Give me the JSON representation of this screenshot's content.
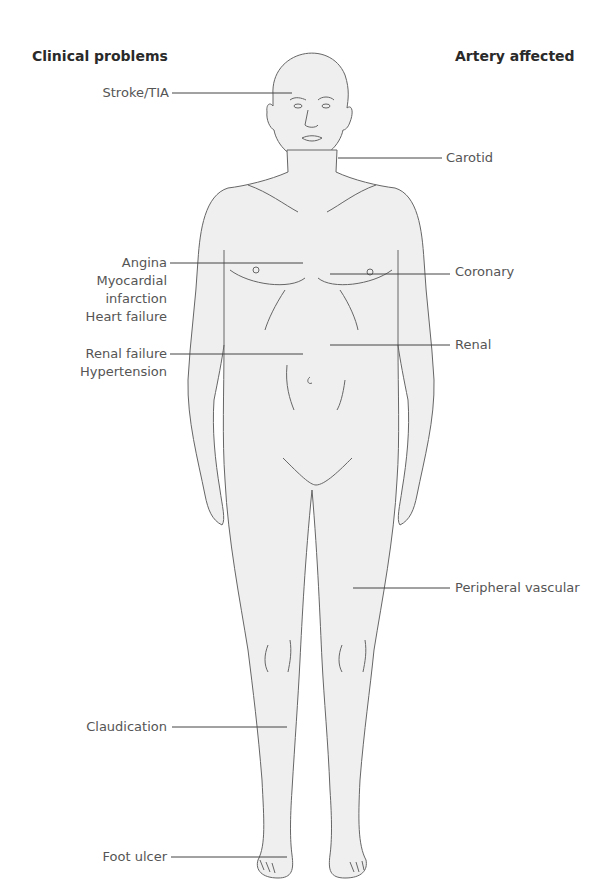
{
  "header": {
    "left": "Clinical problems",
    "right": "Artery affected"
  },
  "clinical_problems": [
    {
      "label": "Stroke/TIA"
    },
    {
      "label": "Angina"
    },
    {
      "label": "Myocardial"
    },
    {
      "label": "infarction"
    },
    {
      "label": "Heart failure"
    },
    {
      "label": "Renal failure"
    },
    {
      "label": "Hypertension"
    },
    {
      "label": "Claudication"
    },
    {
      "label": "Foot ulcer"
    }
  ],
  "arteries": [
    {
      "label": "Carotid"
    },
    {
      "label": "Coronary"
    },
    {
      "label": "Renal"
    },
    {
      "label": "Peripheral vascular"
    }
  ],
  "colors": {
    "body_fill": "#efefef",
    "outline": "#666666",
    "leader_line": "#444444",
    "label_text": "#555555",
    "header_text": "#2a2a2a"
  }
}
